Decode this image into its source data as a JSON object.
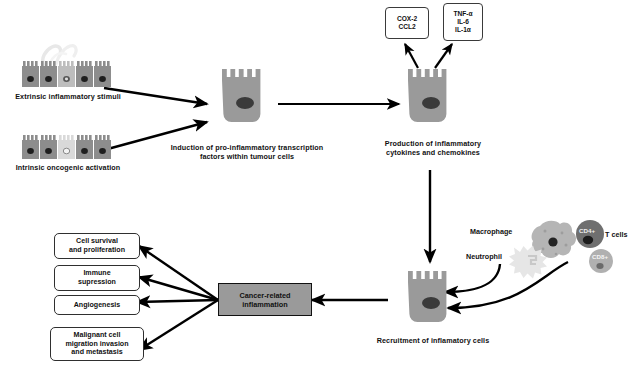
{
  "diagram": {
    "stimuli": {
      "extrinsic_label": "Extrinsic inflammatory stimuli",
      "intrinsic_label": "Intrinsic oncogenic activation"
    },
    "steps": {
      "induction_label": "Induction of pro-inflammatory transcription factors within tumour cells",
      "induction_line1": "Induction of pro-inflammatory transcription",
      "induction_line2": "factors within tumour cells",
      "production_line1": "Production of inflammatory",
      "production_line2": "cytokines and chemokines",
      "recruitment_label": "Recruitment of inflamatory cells"
    },
    "mediator_boxes": [
      {
        "name": "cox-ccl-box",
        "lines": [
          "COX-2",
          "CCL2"
        ]
      },
      {
        "name": "cytokine-box",
        "lines": [
          "TNF-α",
          "IL-6",
          "IL-1α"
        ]
      }
    ],
    "immune_cells": [
      {
        "name": "macrophage",
        "label": "Macrophage"
      },
      {
        "name": "neutrophil",
        "label": "Neutrophil"
      },
      {
        "name": "cd4-t-cell",
        "label": "CD4+"
      },
      {
        "name": "cd8-t-cell",
        "label": "CD8+"
      },
      {
        "name": "t-cells-group",
        "label": "T cells"
      }
    ],
    "central_node": {
      "line1": "Cancer-related",
      "line2": "inflammation"
    },
    "outcomes": [
      {
        "name": "cell-survival",
        "lines": [
          "Cell survival",
          "and proliferation"
        ]
      },
      {
        "name": "immune-suppression",
        "lines": [
          "Immune",
          "supression"
        ]
      },
      {
        "name": "angiogenesis",
        "lines": [
          "Angiogenesis"
        ]
      },
      {
        "name": "metastasis",
        "lines": [
          "Malignant cell",
          "migration invasion",
          "and metastasis"
        ]
      }
    ],
    "colors": {
      "cell_body": "#9a9a9a",
      "cell_body_dark": "#8d8d8d",
      "nucleus": "#2b2b2b",
      "pale_cell": "#d9d9d9",
      "central_fill": "#9a9a9a",
      "arrow": "#000000",
      "macrophage": "#b5b5b5",
      "neutrophil": "#e2e2e2",
      "cd4": "#6f6f6f",
      "cd8": "#b0b0b0"
    }
  }
}
